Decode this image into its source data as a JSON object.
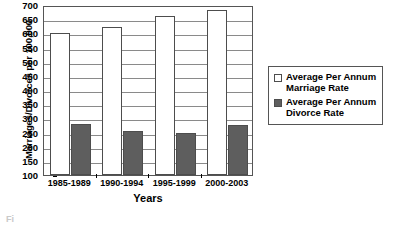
{
  "chart_data": {
    "type": "bar",
    "title": "",
    "xlabel": "Years",
    "ylabel": "Marriages/Divorces per 100,000",
    "categories": [
      "1985-1989",
      "1990-1994",
      "1995-1999",
      "2000-2003"
    ],
    "series": [
      {
        "name": "Average Per Annum Marriage Rate",
        "values": [
          600,
          622,
          660,
          682
        ],
        "color": "#ffffff"
      },
      {
        "name": "Average Per Annum Divorce Rate",
        "values": [
          280,
          255,
          248,
          275
        ],
        "color": "#5e5e5e"
      }
    ],
    "ylim": [
      100,
      700
    ],
    "ytick_labels": [
      "100",
      "150",
      "200",
      "250",
      "300",
      "350",
      "400",
      "450",
      "500",
      "550",
      "600",
      "650",
      "700"
    ],
    "ytick_values": [
      100,
      150,
      200,
      250,
      300,
      350,
      400,
      450,
      500,
      550,
      600,
      650,
      700
    ],
    "grid": true,
    "legend_position": "right"
  },
  "legend": {
    "entries": [
      {
        "label_line1": "Average Per Annum",
        "label_line2": "Marriage Rate",
        "swatch": "hollow"
      },
      {
        "label_line1": "Average Per Annum",
        "label_line2": "Divorce Rate",
        "swatch": "filled"
      }
    ]
  },
  "caption": {
    "fragment": "Fi"
  }
}
